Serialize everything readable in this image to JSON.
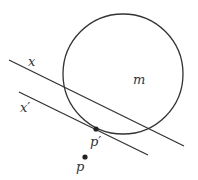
{
  "diagram": {
    "circle": {
      "label": "m",
      "cx": 123,
      "cy": 74,
      "r": 60,
      "stroke": "#333333"
    },
    "lines": [
      {
        "name": "x",
        "label": "x",
        "x1": 9,
        "y1": 60,
        "x2": 184,
        "y2": 146
      },
      {
        "name": "x-prime",
        "label": "x′",
        "x1": 19,
        "y1": 92,
        "x2": 148,
        "y2": 155
      }
    ],
    "points": [
      {
        "name": "p-prime",
        "label": "p′",
        "cx": 96,
        "cy": 129
      },
      {
        "name": "p",
        "label": "p",
        "cx": 85,
        "cy": 157
      }
    ],
    "labels": {
      "x": "x",
      "x_prime": "x′",
      "m": "m",
      "p_prime": "p′",
      "p": "p"
    }
  }
}
